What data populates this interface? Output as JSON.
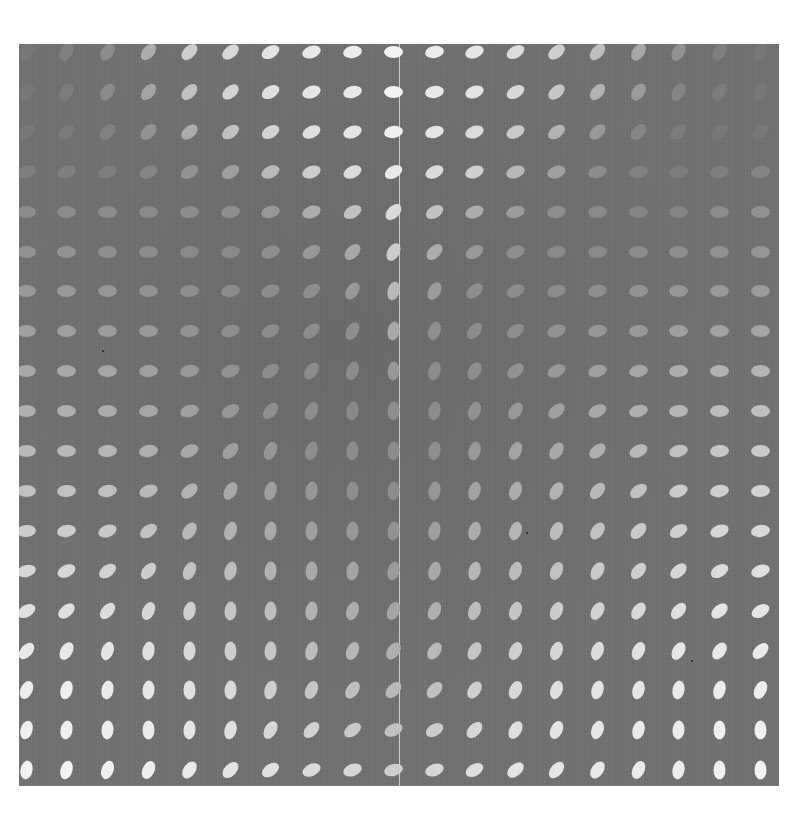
{
  "artwork": {
    "description": "Gray square field with a 19x19 grid of light ellipses varying in orientation and brightness",
    "background_color": "#727272",
    "ellipse_color": "#f2f2f2",
    "seam_color": "#ebebeb",
    "grid": {
      "rows": 19,
      "cols": 19
    },
    "angle_convention": "degrees, 0 = horizontal, negative = tilted up-right, 90 = vertical",
    "angles": [
      [
        -60,
        -60,
        -55,
        -50,
        -45,
        -40,
        -30,
        -20,
        -10,
        0,
        -10,
        -20,
        -30,
        -40,
        -50,
        -55,
        -60,
        -60,
        -60
      ],
      [
        -60,
        -60,
        -55,
        -50,
        -45,
        -40,
        -30,
        -20,
        -15,
        0,
        -10,
        -20,
        -30,
        -40,
        -50,
        -55,
        -60,
        -60,
        -60
      ],
      [
        -45,
        -45,
        -45,
        -45,
        -40,
        -35,
        -30,
        -25,
        -20,
        -10,
        -15,
        -20,
        -25,
        -35,
        -40,
        -45,
        -45,
        -45,
        -45
      ],
      [
        -20,
        -20,
        -20,
        -25,
        -30,
        -30,
        -25,
        -20,
        -25,
        -30,
        -25,
        -20,
        -20,
        -20,
        -15,
        -10,
        -10,
        -10,
        -10
      ],
      [
        0,
        0,
        0,
        0,
        -5,
        -10,
        -15,
        -20,
        -30,
        -45,
        -30,
        -20,
        -15,
        -10,
        -5,
        0,
        0,
        0,
        0
      ],
      [
        0,
        0,
        0,
        0,
        -5,
        -10,
        -20,
        -30,
        -45,
        -60,
        -45,
        -30,
        -20,
        -10,
        -5,
        0,
        0,
        0,
        0
      ],
      [
        0,
        0,
        0,
        0,
        -5,
        -10,
        -20,
        -35,
        -55,
        -75,
        -60,
        -40,
        -25,
        -15,
        -10,
        -5,
        0,
        0,
        0
      ],
      [
        0,
        0,
        0,
        0,
        -5,
        -15,
        -25,
        -40,
        -60,
        -80,
        -70,
        -50,
        -35,
        -20,
        -10,
        -5,
        0,
        0,
        0
      ],
      [
        0,
        0,
        0,
        -5,
        -10,
        -20,
        -35,
        -55,
        -70,
        -85,
        -75,
        -60,
        -40,
        -25,
        -15,
        -10,
        -5,
        0,
        0
      ],
      [
        0,
        0,
        0,
        -5,
        -15,
        -30,
        -50,
        -65,
        -80,
        -85,
        -80,
        -70,
        -55,
        -40,
        -25,
        -15,
        -5,
        0,
        0
      ],
      [
        0,
        0,
        -5,
        -10,
        -25,
        -45,
        -65,
        -75,
        -85,
        -85,
        -80,
        -75,
        -65,
        -55,
        -40,
        -25,
        -15,
        -5,
        0
      ],
      [
        0,
        -5,
        -10,
        -20,
        -40,
        -60,
        -75,
        -80,
        -85,
        -85,
        -80,
        -75,
        -70,
        -60,
        -50,
        -35,
        -20,
        -10,
        -5
      ],
      [
        -5,
        -10,
        -20,
        -35,
        -55,
        -70,
        -80,
        -85,
        -85,
        -80,
        -80,
        -75,
        -70,
        -65,
        -55,
        -45,
        -30,
        -20,
        -10
      ],
      [
        -15,
        -25,
        -35,
        -50,
        -65,
        -75,
        -85,
        -85,
        -80,
        -75,
        -75,
        -75,
        -70,
        -65,
        -60,
        -50,
        -40,
        -30,
        -20
      ],
      [
        -30,
        -40,
        -50,
        -65,
        -75,
        -85,
        -85,
        -80,
        -70,
        -65,
        -65,
        -70,
        -70,
        -65,
        -60,
        -55,
        -50,
        -40,
        -30
      ],
      [
        -50,
        -60,
        -70,
        -80,
        -85,
        -90,
        -85,
        -75,
        -65,
        -55,
        -55,
        -60,
        -65,
        -70,
        -70,
        -65,
        -60,
        -55,
        -45
      ],
      [
        -65,
        -75,
        -80,
        -85,
        -90,
        -85,
        -75,
        -65,
        -55,
        -45,
        -45,
        -55,
        -65,
        -70,
        -75,
        -75,
        -80,
        -75,
        -65
      ],
      [
        -75,
        -80,
        -85,
        -90,
        -85,
        -75,
        -60,
        -45,
        -35,
        -25,
        -30,
        -45,
        -60,
        -65,
        -70,
        -75,
        -85,
        -90,
        -90
      ],
      [
        -80,
        -75,
        -70,
        -65,
        -55,
        -45,
        -35,
        -25,
        -20,
        -15,
        -20,
        -30,
        -40,
        -50,
        -55,
        -65,
        -80,
        -90,
        -90
      ]
    ],
    "brightness": [
      [
        0.05,
        0.12,
        0.2,
        0.45,
        0.7,
        0.8,
        0.88,
        0.92,
        0.95,
        1.0,
        0.95,
        0.9,
        0.82,
        0.72,
        0.6,
        0.42,
        0.25,
        0.1,
        0.05
      ],
      [
        0.05,
        0.08,
        0.18,
        0.38,
        0.62,
        0.75,
        0.85,
        0.9,
        0.93,
        1.0,
        0.92,
        0.88,
        0.8,
        0.65,
        0.5,
        0.32,
        0.15,
        0.08,
        0.05
      ],
      [
        0.05,
        0.06,
        0.12,
        0.25,
        0.45,
        0.62,
        0.75,
        0.85,
        0.9,
        0.98,
        0.9,
        0.82,
        0.68,
        0.5,
        0.3,
        0.15,
        0.08,
        0.05,
        0.05
      ],
      [
        0.1,
        0.1,
        0.1,
        0.15,
        0.25,
        0.35,
        0.55,
        0.7,
        0.82,
        0.92,
        0.82,
        0.72,
        0.55,
        0.35,
        0.2,
        0.12,
        0.08,
        0.1,
        0.15
      ],
      [
        0.2,
        0.2,
        0.2,
        0.18,
        0.2,
        0.22,
        0.3,
        0.45,
        0.62,
        0.82,
        0.62,
        0.45,
        0.32,
        0.22,
        0.18,
        0.15,
        0.15,
        0.2,
        0.25
      ],
      [
        0.25,
        0.25,
        0.22,
        0.2,
        0.18,
        0.18,
        0.22,
        0.3,
        0.42,
        0.7,
        0.45,
        0.3,
        0.22,
        0.18,
        0.18,
        0.2,
        0.22,
        0.25,
        0.28
      ],
      [
        0.3,
        0.3,
        0.28,
        0.25,
        0.22,
        0.2,
        0.2,
        0.22,
        0.3,
        0.55,
        0.32,
        0.22,
        0.2,
        0.2,
        0.22,
        0.25,
        0.28,
        0.3,
        0.32
      ],
      [
        0.35,
        0.35,
        0.32,
        0.3,
        0.25,
        0.22,
        0.2,
        0.2,
        0.22,
        0.42,
        0.22,
        0.2,
        0.22,
        0.25,
        0.28,
        0.3,
        0.35,
        0.38,
        0.4
      ],
      [
        0.42,
        0.42,
        0.4,
        0.35,
        0.3,
        0.25,
        0.2,
        0.2,
        0.2,
        0.3,
        0.2,
        0.22,
        0.25,
        0.3,
        0.35,
        0.4,
        0.45,
        0.5,
        0.52
      ],
      [
        0.48,
        0.48,
        0.45,
        0.4,
        0.35,
        0.28,
        0.22,
        0.2,
        0.18,
        0.22,
        0.2,
        0.25,
        0.3,
        0.35,
        0.42,
        0.48,
        0.52,
        0.58,
        0.6
      ],
      [
        0.55,
        0.55,
        0.52,
        0.48,
        0.42,
        0.35,
        0.28,
        0.22,
        0.2,
        0.2,
        0.22,
        0.3,
        0.38,
        0.42,
        0.48,
        0.55,
        0.6,
        0.65,
        0.68
      ],
      [
        0.62,
        0.62,
        0.6,
        0.55,
        0.5,
        0.42,
        0.35,
        0.28,
        0.22,
        0.2,
        0.28,
        0.38,
        0.45,
        0.5,
        0.55,
        0.62,
        0.68,
        0.72,
        0.75
      ],
      [
        0.7,
        0.7,
        0.68,
        0.62,
        0.55,
        0.5,
        0.42,
        0.35,
        0.3,
        0.25,
        0.35,
        0.45,
        0.52,
        0.58,
        0.62,
        0.68,
        0.72,
        0.78,
        0.8
      ],
      [
        0.78,
        0.78,
        0.75,
        0.7,
        0.62,
        0.58,
        0.5,
        0.42,
        0.38,
        0.32,
        0.42,
        0.52,
        0.58,
        0.62,
        0.68,
        0.72,
        0.78,
        0.82,
        0.85
      ],
      [
        0.85,
        0.85,
        0.82,
        0.78,
        0.72,
        0.65,
        0.58,
        0.5,
        0.45,
        0.4,
        0.48,
        0.58,
        0.65,
        0.7,
        0.75,
        0.8,
        0.84,
        0.88,
        0.9
      ],
      [
        0.92,
        0.92,
        0.9,
        0.85,
        0.8,
        0.72,
        0.65,
        0.58,
        0.52,
        0.48,
        0.55,
        0.65,
        0.72,
        0.78,
        0.82,
        0.86,
        0.9,
        0.92,
        0.94
      ],
      [
        0.96,
        0.96,
        0.94,
        0.9,
        0.86,
        0.8,
        0.72,
        0.66,
        0.6,
        0.55,
        0.62,
        0.72,
        0.8,
        0.84,
        0.88,
        0.9,
        0.93,
        0.95,
        0.97
      ],
      [
        0.98,
        0.98,
        0.96,
        0.94,
        0.9,
        0.85,
        0.8,
        0.74,
        0.68,
        0.62,
        0.7,
        0.78,
        0.84,
        0.88,
        0.9,
        0.93,
        0.95,
        0.97,
        0.98
      ],
      [
        1.0,
        1.0,
        0.98,
        0.96,
        0.93,
        0.9,
        0.86,
        0.82,
        0.78,
        0.72,
        0.78,
        0.84,
        0.88,
        0.9,
        0.92,
        0.94,
        0.96,
        0.98,
        1.0
      ]
    ]
  }
}
